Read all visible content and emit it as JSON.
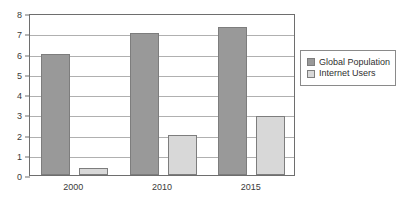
{
  "chart_data": {
    "type": "bar",
    "title": "",
    "subtitle": "",
    "xlabel": "",
    "ylabel": "",
    "categories": [
      "2000",
      "2010",
      "2015"
    ],
    "series": [
      {
        "name": "Global Population",
        "color": "#999999",
        "values": [
          6.0,
          7.0,
          7.3
        ]
      },
      {
        "name": "Internet Users",
        "color": "#d8d8d8",
        "values": [
          0.35,
          2.0,
          2.9
        ]
      }
    ],
    "ylim": [
      0,
      8
    ],
    "y_ticks": [
      "0",
      "1",
      "2",
      "3",
      "4",
      "5",
      "6",
      "7",
      "8"
    ],
    "grid": true,
    "legend_position": "right",
    "annotations": []
  },
  "legend": {
    "items": [
      {
        "label": "Global Population",
        "swatch": "#999999"
      },
      {
        "label": "Internet Users",
        "swatch": "#d8d8d8"
      }
    ]
  },
  "colors": {
    "series_dark": "#999999",
    "series_light": "#d8d8d8",
    "bar_border": "#7d7d7d",
    "axis": "#6e6e6e",
    "gridline": "#b0b0b0",
    "text": "#3a3a3a",
    "background": "#ffffff"
  }
}
